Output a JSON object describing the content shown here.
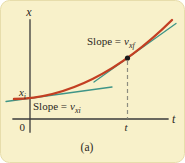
{
  "figure": {
    "caption": "(a)",
    "y_axis_label": "x",
    "x_axis_label": "t",
    "origin_label": "0",
    "initial_position_label": {
      "var": "x",
      "sub": "i"
    },
    "time_tick_label": "t",
    "slope_final_label": {
      "prefix": "Slope =",
      "var": "v",
      "sub": "xf"
    },
    "slope_initial_label": {
      "prefix": "Slope =",
      "var": "v",
      "sub": "xi"
    },
    "colors": {
      "background": "#f8f1ca",
      "curve": "#c33f22",
      "tangent": "#3f9587",
      "axis": "#3a3a3a"
    }
  }
}
